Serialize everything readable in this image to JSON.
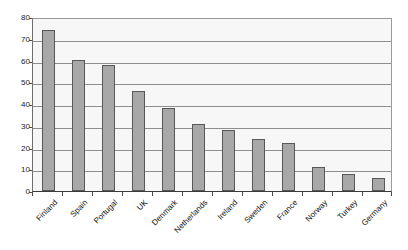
{
  "chart_data": {
    "type": "bar",
    "title": "",
    "subtitle": "",
    "xlabel": "",
    "ylabel": "",
    "ylim": [
      0,
      80
    ],
    "ytick_step": 10,
    "yticks": [
      "80",
      "70",
      "60",
      "50",
      "40",
      "30",
      "20",
      "10",
      "0"
    ],
    "grid": true,
    "legend": false,
    "legend_position": "none",
    "orientation": "vertical",
    "label_rotation": -45,
    "categories": [
      "Finland",
      "Spain",
      "Portugal",
      "UK",
      "Denmark",
      "Netherlands",
      "Ireland",
      "Sweden",
      "France",
      "Norway",
      "Turkey",
      "Germany"
    ],
    "values": [
      74,
      60,
      58,
      46,
      38,
      31,
      28,
      24,
      22,
      11,
      8,
      6
    ],
    "series": [
      {
        "name": "",
        "values": [
          74,
          60,
          58,
          46,
          38,
          31,
          28,
          24,
          22,
          11,
          8,
          6
        ]
      }
    ]
  },
  "style": {
    "bar_fill": "#a8a8a8",
    "bar_stroke": "#585858",
    "plot_background": "#f7f7f7",
    "gridline_color": "#8f8f8f",
    "axis_color": "#3a3a3a",
    "text_color": "#111111",
    "page_background": "#ffffff"
  }
}
